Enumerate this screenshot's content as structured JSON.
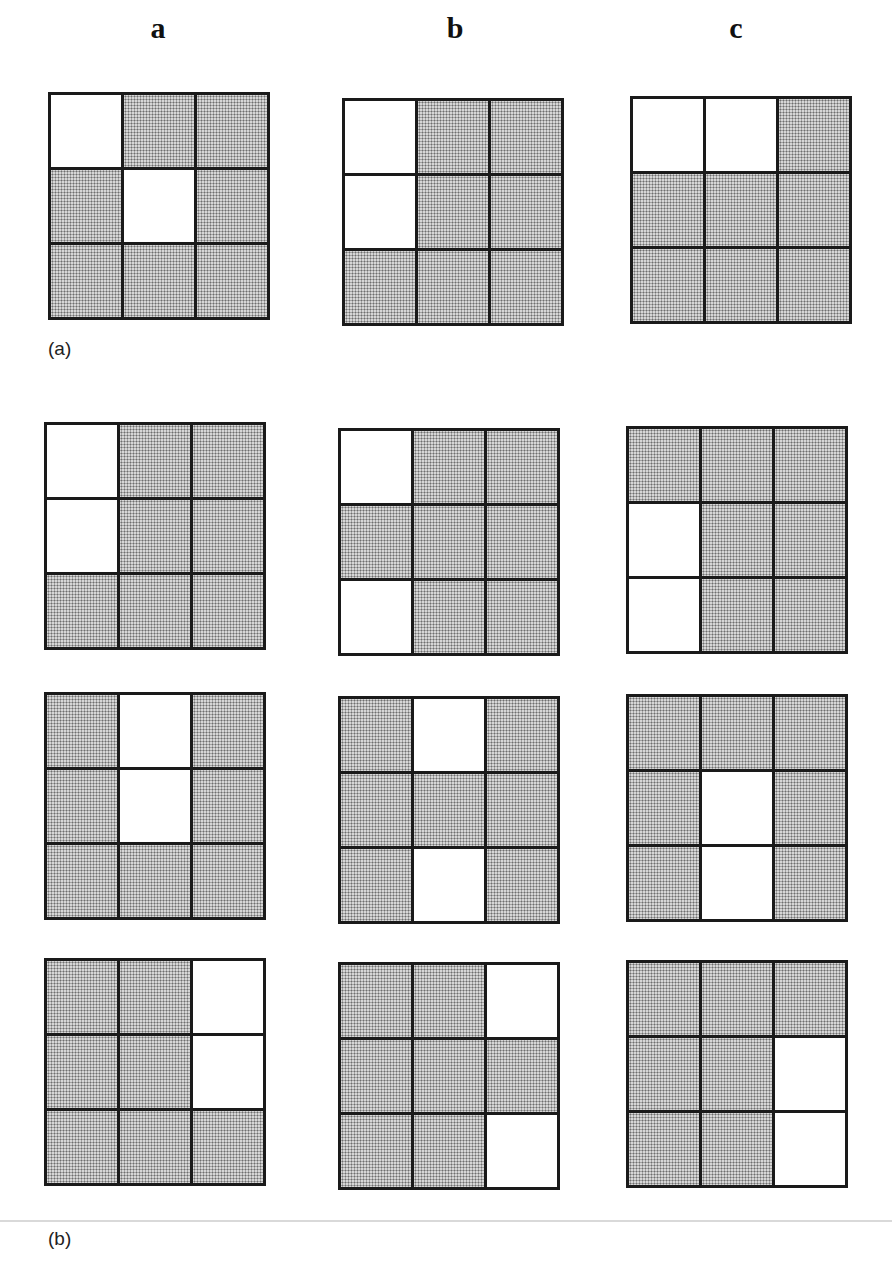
{
  "column_labels": [
    "a",
    "b",
    "c"
  ],
  "panel_labels": {
    "a": "(a)",
    "b": "(b)"
  },
  "colors": {
    "grid_line": "#1a1a1a",
    "shaded_fill": "#d6d6d6",
    "stipple_dot": "#6e6e6e",
    "open_fill": "#ffffff",
    "separator": "#d9d9d9"
  },
  "legend": {
    "shaded": "stippled cell",
    "open": "white (open) cell"
  },
  "panel_a": {
    "rows": [
      {
        "grids": [
          {
            "column": "a",
            "open_cells": [
              [
                0,
                0
              ],
              [
                1,
                1
              ]
            ]
          },
          {
            "column": "b",
            "open_cells": [
              [
                0,
                0
              ],
              [
                1,
                0
              ]
            ]
          },
          {
            "column": "c",
            "open_cells": [
              [
                0,
                0
              ],
              [
                0,
                1
              ]
            ]
          }
        ]
      }
    ]
  },
  "panel_b": {
    "rows": [
      {
        "grids": [
          {
            "column": "a",
            "open_cells": [
              [
                0,
                0
              ],
              [
                1,
                0
              ]
            ]
          },
          {
            "column": "b",
            "open_cells": [
              [
                0,
                0
              ],
              [
                2,
                0
              ]
            ]
          },
          {
            "column": "c",
            "open_cells": [
              [
                1,
                0
              ],
              [
                2,
                0
              ]
            ]
          }
        ]
      },
      {
        "grids": [
          {
            "column": "a",
            "open_cells": [
              [
                0,
                1
              ],
              [
                1,
                1
              ]
            ]
          },
          {
            "column": "b",
            "open_cells": [
              [
                0,
                1
              ],
              [
                2,
                1
              ]
            ]
          },
          {
            "column": "c",
            "open_cells": [
              [
                1,
                1
              ],
              [
                2,
                1
              ]
            ]
          }
        ]
      },
      {
        "grids": [
          {
            "column": "a",
            "open_cells": [
              [
                0,
                2
              ],
              [
                1,
                2
              ]
            ]
          },
          {
            "column": "b",
            "open_cells": [
              [
                0,
                2
              ],
              [
                2,
                2
              ]
            ]
          },
          {
            "column": "c",
            "open_cells": [
              [
                1,
                2
              ],
              [
                2,
                2
              ]
            ]
          }
        ]
      }
    ]
  }
}
